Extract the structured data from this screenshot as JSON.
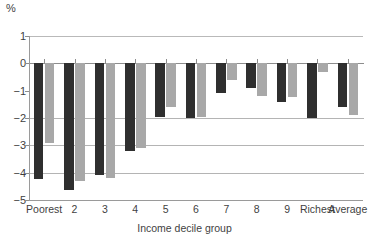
{
  "chart_data": {
    "type": "bar",
    "title": "",
    "subtitle": "",
    "unit_label": "%",
    "xlabel": "Income decile group",
    "ylabel": "",
    "categories": [
      "Poorest",
      "2",
      "3",
      "4",
      "5",
      "6",
      "7",
      "8",
      "9",
      "Richest",
      "Average"
    ],
    "ylim": [
      -5,
      1
    ],
    "yticks": [
      1,
      0,
      -1,
      -2,
      -3,
      -4,
      -5
    ],
    "ytick_labels": [
      "1",
      "0",
      "−1",
      "−2",
      "−3",
      "−4",
      "−5"
    ],
    "grid": true,
    "gridlines_at": [
      -2,
      -3,
      -4
    ],
    "legend": "none",
    "legend_position": "none",
    "series": [
      {
        "name": "series-dark",
        "color": "#2f2f2f",
        "values": [
          -4.25,
          -4.65,
          -4.1,
          -3.2,
          -1.95,
          -2.0,
          -1.1,
          -0.9,
          -1.4,
          -2.0,
          -1.6
        ]
      },
      {
        "name": "series-light",
        "color": "#a8a8a8",
        "values": [
          -2.9,
          -4.3,
          -4.2,
          -3.1,
          -1.6,
          -1.95,
          -0.6,
          -1.2,
          -1.25,
          -0.3,
          -1.9
        ]
      }
    ]
  },
  "axes": {
    "unit": "%",
    "x_axis_title": "Income decile group"
  }
}
